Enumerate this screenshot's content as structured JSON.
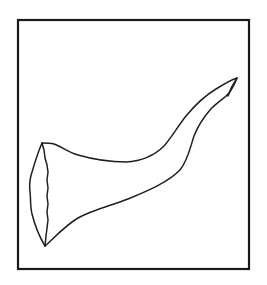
{
  "figure": {
    "frame": {
      "x": 18,
      "y": 20,
      "width": 231,
      "height": 249
    },
    "colors": {
      "background": "#ffffff",
      "stroke": "#1f1f1f",
      "frame": "#1a1a1a"
    },
    "caption": ""
  }
}
